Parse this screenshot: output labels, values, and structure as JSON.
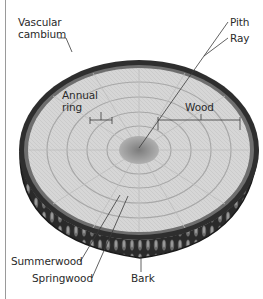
{
  "diagram": {
    "labels": {
      "vascular_cambium_line1": "Vascular",
      "vascular_cambium_line2": "cambium",
      "pith": "Pith",
      "ray": "Ray",
      "annual_ring_line1": "Annual",
      "annual_ring_line2": "ring",
      "wood": "Wood",
      "summerwood": "Summerwood",
      "springwood": "Springwood",
      "bark": "Bark"
    },
    "colors": {
      "wood_light": "#d9d9d9",
      "wood_mid": "#bdbdbd",
      "pith": "#8e8e8e",
      "bark_dark": "#1e1e1e",
      "bark_mid": "#5a5a5a",
      "leader_line": "#3a3a3a",
      "frame_line": "#9a9a9a"
    }
  }
}
